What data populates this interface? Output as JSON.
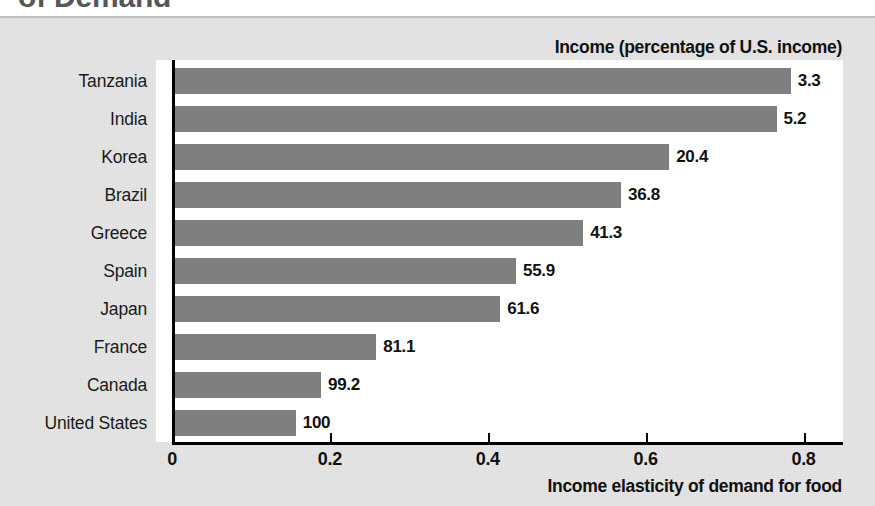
{
  "page": {
    "cut_off_title": "of Demand",
    "background_color": "#e7e7e7",
    "bar_color": "#7f7f7f"
  },
  "header_note": "Income (percentage of U.S. income)",
  "chart_data": {
    "type": "bar",
    "orientation": "horizontal",
    "title": "of Demand",
    "xlabel": "Income elasticity of demand for food",
    "ylabel": "",
    "xlim": [
      0,
      0.85
    ],
    "xticks": [
      0,
      0.2,
      0.4,
      0.6,
      0.8
    ],
    "xticklabels": [
      "0",
      "0.2",
      "0.4",
      "0.6",
      "0.8"
    ],
    "grid": false,
    "legend": "none",
    "annotation": "Income (percentage of U.S. income)",
    "categories": [
      "Tanzania",
      "India",
      "Korea",
      "Brazil",
      "Greece",
      "Spain",
      "Japan",
      "France",
      "Canada",
      "United States"
    ],
    "values": [
      0.78,
      0.762,
      0.626,
      0.565,
      0.517,
      0.432,
      0.412,
      0.255,
      0.185,
      0.153
    ],
    "data_labels": [
      "3.3",
      "5.2",
      "20.4",
      "36.8",
      "41.3",
      "55.9",
      "61.6",
      "81.1",
      "99.2",
      "100"
    ],
    "data_label_meaning": "Income as percentage of U.S. income",
    "series": [
      {
        "name": "Income elasticity of demand for food",
        "values": [
          0.78,
          0.762,
          0.626,
          0.565,
          0.517,
          0.432,
          0.412,
          0.255,
          0.185,
          0.153
        ]
      }
    ],
    "points": [
      {
        "country": "Tanzania",
        "elasticity": 0.78,
        "income_pct_us": 3.3
      },
      {
        "country": "India",
        "elasticity": 0.762,
        "income_pct_us": 5.2
      },
      {
        "country": "Korea",
        "elasticity": 0.626,
        "income_pct_us": 20.4
      },
      {
        "country": "Brazil",
        "elasticity": 0.565,
        "income_pct_us": 36.8
      },
      {
        "country": "Greece",
        "elasticity": 0.517,
        "income_pct_us": 41.3
      },
      {
        "country": "Spain",
        "elasticity": 0.432,
        "income_pct_us": 55.9
      },
      {
        "country": "Japan",
        "elasticity": 0.412,
        "income_pct_us": 61.6
      },
      {
        "country": "France",
        "elasticity": 0.255,
        "income_pct_us": 81.1
      },
      {
        "country": "Canada",
        "elasticity": 0.185,
        "income_pct_us": 99.2
      },
      {
        "country": "United States",
        "elasticity": 0.153,
        "income_pct_us": 100
      }
    ]
  },
  "axis": {
    "x_title": "Income elasticity of demand for food"
  }
}
